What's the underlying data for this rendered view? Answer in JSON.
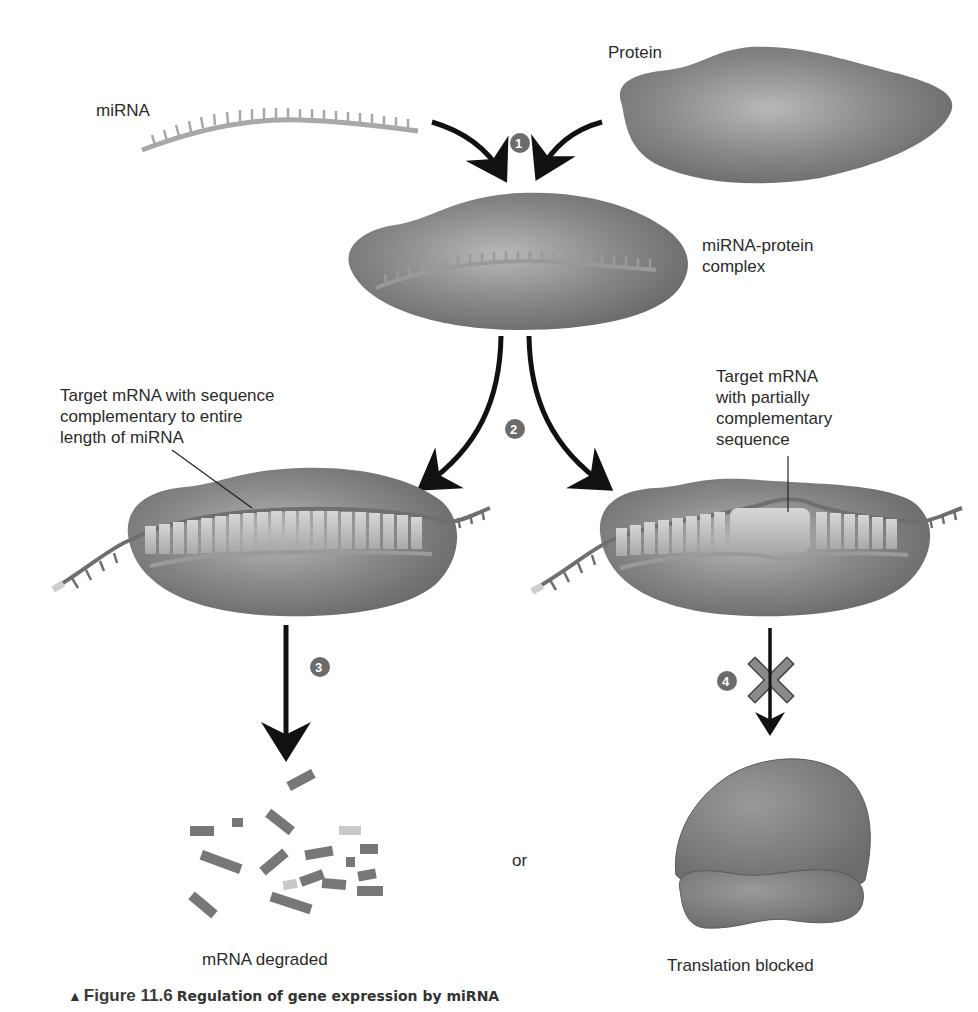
{
  "figure": {
    "number_label": "Figure 11.6",
    "title": "Regulation of gene expression by miRNA",
    "marker": "▲"
  },
  "labels": {
    "mirna": "miRNA",
    "protein": "Protein",
    "complex": "miRNA-protein\ncomplex",
    "target_full": "Target mRNA with sequence\ncomplementary to entire\nlength of miRNA",
    "target_partial": "Target mRNA\nwith partially\ncomplementary\nsequence",
    "or": "or",
    "outcome_degraded": "mRNA degraded",
    "outcome_blocked": "Translation blocked"
  },
  "steps": [
    {
      "number": "1"
    },
    {
      "number": "2"
    },
    {
      "number": "3"
    },
    {
      "number": "4"
    }
  ],
  "colors": {
    "protein_fill": "#7a7a7a",
    "protein_highlight": "#b4b4b4",
    "mirna_strand": "#a8a8a8",
    "mrna_strand": "#6f6f6f",
    "base_pair": "#c8c8c8",
    "arrow": "#111111",
    "step_badge": "#6b6b6b",
    "block_x": "#8a8a8a",
    "fragment": "#777777",
    "fragment_light": "#c9c9c9"
  }
}
